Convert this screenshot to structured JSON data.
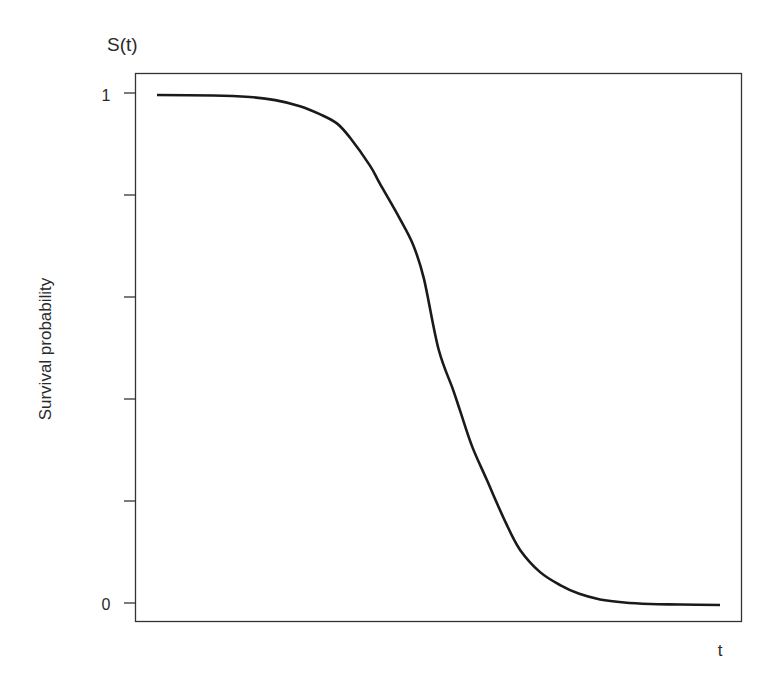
{
  "chart_data": {
    "type": "line",
    "title": "",
    "y_top_label": "S(t)",
    "xlabel": "t",
    "ylabel": "Survival probability",
    "xlim": [
      0,
      1
    ],
    "ylim": [
      0,
      1
    ],
    "x_ticks": [],
    "y_ticks": [
      {
        "value": 1,
        "label": "1"
      },
      {
        "value": 0.8,
        "label": ""
      },
      {
        "value": 0.6,
        "label": ""
      },
      {
        "value": 0.4,
        "label": ""
      },
      {
        "value": 0.2,
        "label": ""
      },
      {
        "value": 0,
        "label": ""
      }
    ],
    "y_tick_labels_shown": [
      "1",
      "0"
    ],
    "grid": false,
    "legend": null,
    "series": [
      {
        "name": "S(t)",
        "color": "#1a1a1a",
        "x": [
          0.0,
          0.1,
          0.165,
          0.21,
          0.254,
          0.29,
          0.32,
          0.343,
          0.378,
          0.396,
          0.43,
          0.455,
          0.474,
          0.5,
          0.526,
          0.538,
          0.56,
          0.586,
          0.62,
          0.645,
          0.68,
          0.716,
          0.75,
          0.787,
          0.83,
          0.876,
          0.93,
          1.0
        ],
        "values": [
          1.0,
          0.999,
          0.996,
          0.99,
          0.978,
          0.962,
          0.944,
          0.916,
          0.862,
          0.826,
          0.76,
          0.706,
          0.64,
          0.502,
          0.422,
          0.382,
          0.31,
          0.245,
          0.16,
          0.108,
          0.065,
          0.039,
          0.022,
          0.011,
          0.005,
          0.002,
          0.001,
          0.0
        ]
      }
    ]
  }
}
